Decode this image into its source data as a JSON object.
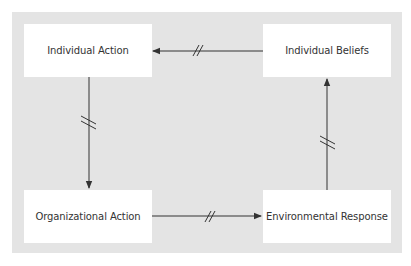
{
  "diagram": {
    "type": "cycle",
    "nodes": [
      {
        "id": "individual-action",
        "label": "Individual Action"
      },
      {
        "id": "individual-beliefs",
        "label": "Individual Beliefs"
      },
      {
        "id": "organizational-action",
        "label": "Organizational Action"
      },
      {
        "id": "environmental-response",
        "label": "Environmental Response"
      }
    ],
    "edges": [
      {
        "from": "individual-beliefs",
        "to": "individual-action",
        "break_mark": "//"
      },
      {
        "from": "individual-action",
        "to": "organizational-action",
        "break_mark": "//"
      },
      {
        "from": "organizational-action",
        "to": "environmental-response",
        "break_mark": "//"
      },
      {
        "from": "environmental-response",
        "to": "individual-beliefs",
        "break_mark": "//"
      }
    ],
    "colors": {
      "panel": "#e4e4e4",
      "box": "#ffffff",
      "line": "#333333",
      "text": "#333333"
    }
  }
}
